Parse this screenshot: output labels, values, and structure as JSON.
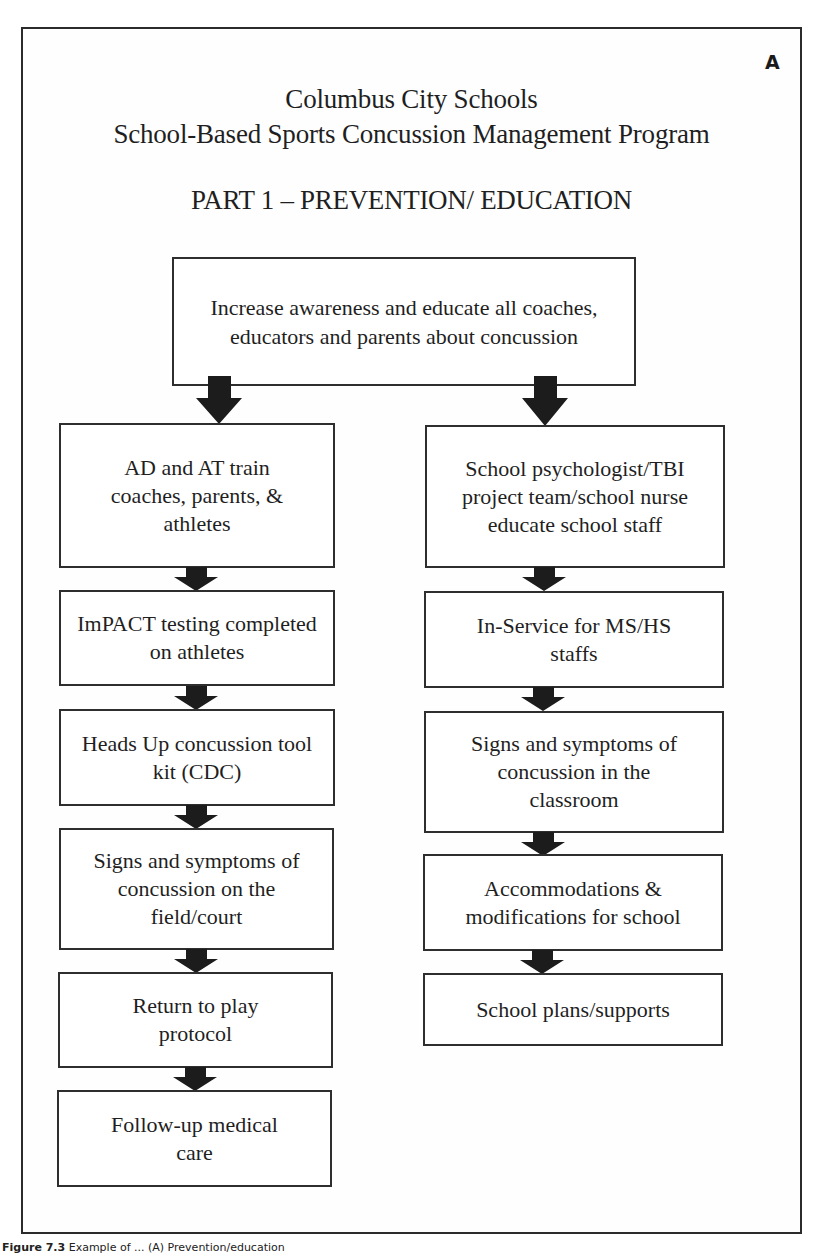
{
  "panel_label": "A",
  "header": {
    "line1": "Columbus City Schools",
    "line2": "School-Based Sports Concussion Management Program",
    "part_title": "PART 1 – PREVENTION/ EDUCATION"
  },
  "top_box": {
    "text": "Increase awareness and educate all coaches, educators and parents about concussion"
  },
  "left_column": {
    "boxes": [
      {
        "text": "AD and AT train coaches, parents, & athletes"
      },
      {
        "text": "ImPACT testing completed on athletes"
      },
      {
        "text": "Heads Up concussion tool kit (CDC)"
      },
      {
        "text": "Signs and symptoms of concussion on the field/court"
      },
      {
        "text": "Return to play protocol"
      },
      {
        "text": "Follow-up medical care"
      }
    ]
  },
  "right_column": {
    "boxes": [
      {
        "text": "School psychologist/TBI project team/school nurse educate school staff"
      },
      {
        "text": "In-Service for MS/HS staffs"
      },
      {
        "text": "Signs and symptoms of concussion in the classroom"
      },
      {
        "text": "Accommodations & modifications for school"
      },
      {
        "text": "School plans/supports"
      }
    ]
  },
  "caption": {
    "label": "Figure 7.3",
    "text": "Example of ... (A) Prevention/education"
  },
  "colors": {
    "stroke": "#2e2e2e",
    "arrow_fill": "#1c1c1c",
    "text": "#1f1f1f",
    "background": "#ffffff"
  }
}
